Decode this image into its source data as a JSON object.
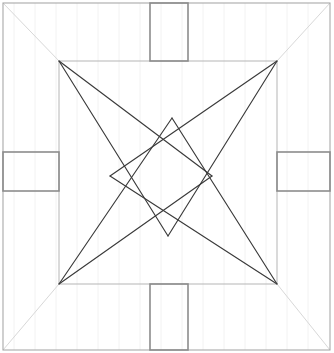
{
  "canvas": {
    "width": 334,
    "height": 353,
    "background_color": "#ffffff",
    "title": "Four-pointed star inscribed in square with edge tabs"
  },
  "colors": {
    "outer_border": "#a9a9a9",
    "inner_square": "#b5b5b5",
    "star_lines": "#3a3a3a",
    "corner_diagonals": "#d8d8d8",
    "tab_stroke": "#8c8c8c",
    "faint_grid": "#f2f2f2",
    "background": "#ffffff"
  },
  "stroke_widths": {
    "outer_border": 1.1,
    "inner_square": 1.0,
    "star_lines": 1.15,
    "corner_diagonals": 1.0,
    "tab_stroke": 1.6,
    "faint_grid": 1.0
  },
  "outer_square": {
    "label": "outer-square",
    "x": 3,
    "y": 3,
    "width": 327,
    "height": 347
  },
  "inner_square": {
    "label": "inner-square",
    "corners": {
      "top_left": {
        "x": 59,
        "y": 61
      },
      "top_right": {
        "x": 277,
        "y": 61
      },
      "bottom_right": {
        "x": 277,
        "y": 284
      },
      "bottom_left": {
        "x": 59,
        "y": 284
      }
    }
  },
  "star": {
    "label": "four-pointed-star",
    "points": [
      {
        "name": "point-top-left",
        "x": 59,
        "y": 61
      },
      {
        "name": "point-top-right",
        "x": 277,
        "y": 61
      },
      {
        "name": "point-bottom-right",
        "x": 277,
        "y": 284
      },
      {
        "name": "point-bottom-left",
        "x": 59,
        "y": 284
      }
    ],
    "crossings": [
      {
        "name": "crossing-top",
        "x": 172,
        "y": 118
      },
      {
        "name": "crossing-right",
        "x": 212,
        "y": 176
      },
      {
        "name": "crossing-bottom",
        "x": 168,
        "y": 236
      },
      {
        "name": "crossing-left",
        "x": 110,
        "y": 176
      }
    ],
    "edges": [
      {
        "from": "point-top-left",
        "to": "crossing-right"
      },
      {
        "from": "point-top-left",
        "to": "crossing-bottom"
      },
      {
        "from": "point-top-right",
        "to": "crossing-left"
      },
      {
        "from": "point-top-right",
        "to": "crossing-bottom"
      },
      {
        "from": "point-bottom-left",
        "to": "crossing-top"
      },
      {
        "from": "point-bottom-left",
        "to": "crossing-right"
      },
      {
        "from": "point-bottom-right",
        "to": "crossing-top"
      },
      {
        "from": "point-bottom-right",
        "to": "crossing-left"
      }
    ]
  },
  "corner_diagonals": [
    {
      "name": "diagonal-top-left",
      "x1": 3,
      "y1": 3,
      "x2": 59,
      "y2": 61
    },
    {
      "name": "diagonal-top-right",
      "x1": 330,
      "y1": 3,
      "x2": 277,
      "y2": 61
    },
    {
      "name": "diagonal-bottom-right",
      "x1": 330,
      "y1": 350,
      "x2": 277,
      "y2": 284
    },
    {
      "name": "diagonal-bottom-left",
      "x1": 3,
      "y1": 350,
      "x2": 59,
      "y2": 284
    }
  ],
  "tabs": [
    {
      "name": "tab-top",
      "side": "top",
      "x": 150,
      "y": 3,
      "width": 38,
      "height": 58
    },
    {
      "name": "tab-left",
      "side": "left",
      "x": 3,
      "y": 152,
      "width": 56,
      "height": 39
    },
    {
      "name": "tab-right",
      "side": "right",
      "x": 277,
      "y": 152,
      "width": 53,
      "height": 39
    },
    {
      "name": "tab-bottom",
      "side": "bottom",
      "x": 150,
      "y": 284,
      "width": 38,
      "height": 66
    }
  ],
  "faint_grid": {
    "name": "faint-vertical-grid",
    "orientation": "vertical",
    "spacing": 21,
    "start_x": 14,
    "count": 15,
    "y_top": 3,
    "y_bottom": 350
  }
}
